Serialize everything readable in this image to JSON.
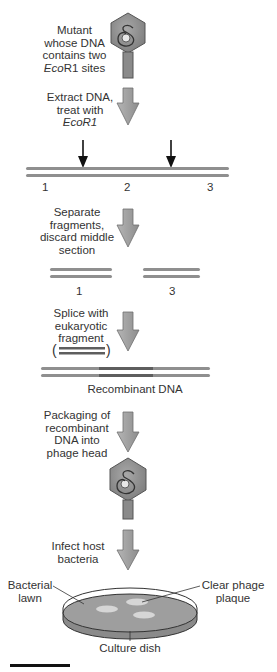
{
  "steps": [
    {
      "id": "mutant",
      "lines": [
        "Mutant",
        "whose DNA",
        "contains two",
        "EcoR1 sites"
      ]
    },
    {
      "id": "extract",
      "lines": [
        "Extract DNA,",
        "treat with",
        "EcoR1"
      ]
    },
    {
      "id": "separate",
      "lines": [
        "Separate",
        "fragments,",
        "discard middle",
        "section"
      ]
    },
    {
      "id": "splice",
      "lines": [
        "Splice with",
        "eukaryotic",
        "fragment"
      ]
    },
    {
      "id": "packaging",
      "lines": [
        "Packaging of",
        "recombinant",
        "DNA into",
        "phage head"
      ]
    },
    {
      "id": "infect",
      "lines": [
        "Infect host",
        "bacteria"
      ]
    }
  ],
  "cut_dna": {
    "segment_labels": [
      "1",
      "2",
      "3"
    ]
  },
  "fragments": {
    "labels": [
      "1",
      "3"
    ]
  },
  "recombinant_label": "Recombinant DNA",
  "dish": {
    "lawn_label": [
      "Bacterial",
      "lawn"
    ],
    "plaque_label": [
      "Clear phage",
      "plaque"
    ],
    "dish_label": "Culture dish"
  },
  "colors": {
    "dna_strand": "#8f8f8f",
    "insert_strand": "#5e5e5e",
    "arrow_fill": "#9a9a9a",
    "phage_fill": "#8a8a8a",
    "lawn_fill": "#9e9e9e",
    "plaque_fill": "#d6d6d6"
  }
}
